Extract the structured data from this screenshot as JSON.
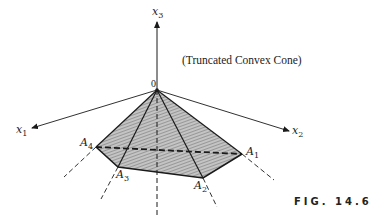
{
  "figure": {
    "title": "(Truncated Convex Cone)",
    "caption": "FIG. 14.6",
    "origin_label": "0",
    "axes": [
      {
        "name": "x1",
        "base": "x",
        "sub": "1"
      },
      {
        "name": "x2",
        "base": "x",
        "sub": "2"
      },
      {
        "name": "x3",
        "base": "x",
        "sub": "3"
      }
    ],
    "vertices": [
      {
        "name": "A1",
        "base": "A",
        "sub": "1"
      },
      {
        "name": "A2",
        "base": "A",
        "sub": "2"
      },
      {
        "name": "A3",
        "base": "A",
        "sub": "3"
      },
      {
        "name": "A4",
        "base": "A",
        "sub": "4"
      }
    ],
    "colors": {
      "line": "#1a1a1a",
      "fill": "#a9a9a9"
    }
  }
}
